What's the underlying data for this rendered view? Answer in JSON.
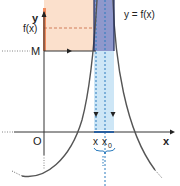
{
  "figure": {
    "labels": {
      "y_axis": "y",
      "x_axis": "x",
      "origin": "O",
      "fx": "f(x)",
      "M": "M",
      "function": "y = f(x)",
      "x": "x",
      "x0": "x",
      "x0_sub": "0"
    },
    "colors": {
      "orange_band": "#fbe0cc",
      "orange_axis": "#f08a5d",
      "blue_strip": "#cde6f6",
      "blue_dark_strip": "#8f98cc",
      "blue_dash": "#2a7bbd",
      "axis": "#333333",
      "curve": "#555555"
    }
  }
}
